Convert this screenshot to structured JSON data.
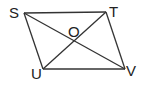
{
  "diagram": {
    "type": "parallelogram-with-diagonals",
    "stroke_color": "#333333",
    "vertices": [
      {
        "label": "S",
        "x": 24,
        "y": 13
      },
      {
        "label": "T",
        "x": 106,
        "y": 12
      },
      {
        "label": "V",
        "x": 125,
        "y": 69
      },
      {
        "label": "U",
        "x": 43,
        "y": 69
      }
    ],
    "intersection": {
      "label": "O",
      "x": 74,
      "y": 41
    },
    "labels": {
      "S": "S",
      "T": "T",
      "U": "U",
      "V": "V",
      "O": "O"
    }
  }
}
